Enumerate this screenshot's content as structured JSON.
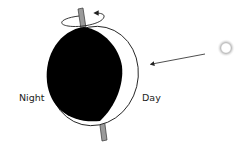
{
  "diagram": {
    "labels": {
      "night": "Night",
      "day": "Day"
    },
    "colors": {
      "night_fill": "#000000",
      "outline": "#222222",
      "axis_fill": "#9a9a9a",
      "sun_glow": "#bdbdbd",
      "background": "#ffffff"
    },
    "icons": {
      "sun": "sun-icon",
      "rotation": "rotation-arrow-icon",
      "sunlight": "sunlight-arrow-icon"
    }
  }
}
